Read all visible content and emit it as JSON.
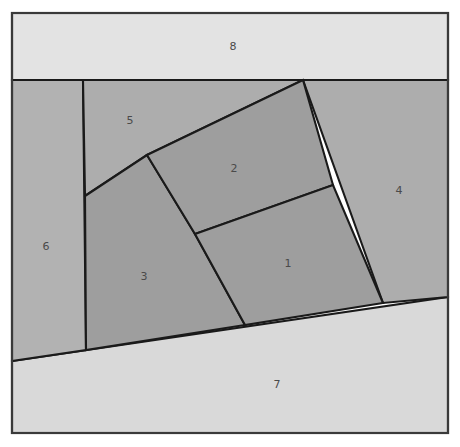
{
  "diagram": {
    "type": "polygon-partition",
    "canvas": {
      "width": 460,
      "height": 447
    },
    "frame": {
      "x": 12,
      "y": 13,
      "width": 436,
      "height": 420,
      "stroke_color": "#3a3a3a"
    },
    "edge_color": "#1a1a1a",
    "label_color": "#4a4a4a",
    "regions": [
      {
        "id": "region-1",
        "label": "1",
        "fill": "#9e9e9e",
        "label_x": 288,
        "label_y": 264,
        "points": "195,234 333,185 383,303 245,325"
      },
      {
        "id": "region-2",
        "label": "2",
        "fill": "#9e9e9e",
        "label_x": 234,
        "label_y": 169,
        "points": "147,155 303,80 333,185 195,234"
      },
      {
        "id": "region-3",
        "label": "3",
        "fill": "#9e9e9e",
        "label_x": 144,
        "label_y": 277,
        "points": "85,196 147,155 195,234 245,325 86,350"
      },
      {
        "id": "region-4",
        "label": "4",
        "fill": "#adadad",
        "label_x": 399,
        "label_y": 191,
        "points": "303,80 448,80 448,297 383,303"
      },
      {
        "id": "region-5",
        "label": "5",
        "fill": "#adadad",
        "label_x": 130,
        "label_y": 121,
        "points": "83,80 303,80 147,155 85,196"
      },
      {
        "id": "region-6",
        "label": "6",
        "fill": "#b2b2b2",
        "label_x": 46,
        "label_y": 247,
        "points": "12,80 83,80 86,350 12,361"
      },
      {
        "id": "region-7",
        "label": "7",
        "fill": "#d9d9d9",
        "label_x": 277,
        "label_y": 385,
        "points": "12,361 448,297 448,433 12,433"
      },
      {
        "id": "region-8",
        "label": "8",
        "fill": "#e3e3e3",
        "label_x": 233,
        "label_y": 47,
        "points": "12,13 448,13 448,80 12,80"
      }
    ]
  }
}
